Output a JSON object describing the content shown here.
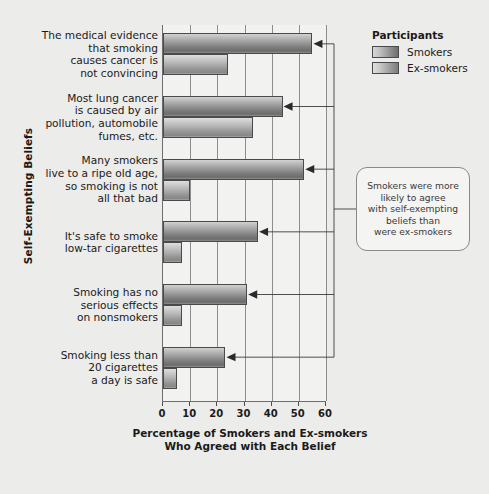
{
  "chart_data": {
    "type": "bar",
    "orientation": "horizontal",
    "title": "",
    "xlabel": "Percentage of Smokers and Ex-smokers Who Agreed with Each Belief",
    "ylabel": "Self-Exempting Beliefs",
    "xlim": [
      0,
      60
    ],
    "xticks": [
      0,
      10,
      20,
      30,
      40,
      50,
      60
    ],
    "grid": true,
    "grid_axis": "x",
    "legend_position": "top-right",
    "legend_title": "Participants",
    "categories": [
      "The medical evidence that smoking causes cancer is not convincing",
      "Most lung cancer is caused by air pollution, automobile fumes, etc.",
      "Many smokers live to a ripe old age, so smoking is not all that bad",
      "It's safe to smoke low-tar cigarettes",
      "Smoking has no serious effects on nonsmokers",
      "Smoking less than 20 cigarettes a day is safe"
    ],
    "category_lines": [
      [
        "The medical evidence",
        "that smoking",
        "causes cancer is",
        "not convincing"
      ],
      [
        "Most lung cancer",
        "is caused by air",
        "pollution, automobile",
        "fumes, etc."
      ],
      [
        "Many smokers",
        "live to a ripe old age,",
        "so smoking is not",
        "all that bad"
      ],
      [
        "It's safe to smoke",
        "low-tar cigarettes"
      ],
      [
        "Smoking has no",
        "serious effects",
        "on nonsmokers"
      ],
      [
        "Smoking less than",
        "20 cigarettes",
        "a day is safe"
      ]
    ],
    "series": [
      {
        "name": "Smokers",
        "values": [
          55,
          44,
          52,
          35,
          31,
          23
        ]
      },
      {
        "name": "Ex-smokers",
        "values": [
          24,
          33,
          10,
          7,
          7,
          5
        ]
      }
    ],
    "annotations": [
      {
        "name": "smokers-agree-more-callout",
        "lines": [
          "Smokers were more",
          "likely to agree",
          "with self-exempting",
          "beliefs than",
          "were ex-smokers"
        ],
        "points_to": "all-smoker-bars"
      }
    ]
  },
  "axis": {
    "x_title_lines": [
      "Percentage of Smokers and Ex-smokers",
      "Who Agreed with Each Belief"
    ],
    "y_title": "Self-Exempting Beliefs",
    "tick_labels": [
      "0",
      "10",
      "20",
      "30",
      "40",
      "50",
      "60"
    ]
  },
  "legend": {
    "title": "Participants",
    "entries": [
      {
        "label": "Smokers"
      },
      {
        "label": "Ex-smokers"
      }
    ]
  },
  "colors": {
    "background": "#ececeb",
    "plot_background": "#f2f2f1",
    "smokers_bar": "#8e8e8e",
    "exsmokers_bar": "#a5a5a5",
    "axis_line": "#6d6d6d",
    "gridline": "#8d8d8d",
    "text": "#1a1a1a",
    "callout_border": "#8a8a8a"
  }
}
